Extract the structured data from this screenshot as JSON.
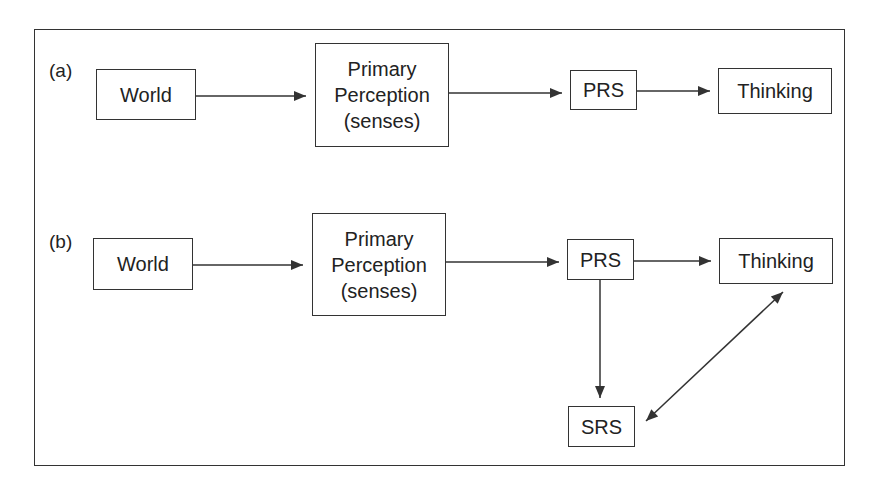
{
  "diagram": {
    "panels": [
      {
        "label": "(a)",
        "nodes": {
          "world": "World",
          "primary_perception": "Primary\nPerception\n(senses)",
          "prs": "PRS",
          "thinking": "Thinking"
        },
        "edges": [
          {
            "from": "World",
            "to": "Primary Perception (senses)",
            "type": "directed"
          },
          {
            "from": "Primary Perception (senses)",
            "to": "PRS",
            "type": "directed"
          },
          {
            "from": "PRS",
            "to": "Thinking",
            "type": "directed"
          }
        ]
      },
      {
        "label": "(b)",
        "nodes": {
          "world": "World",
          "primary_perception": "Primary\nPerception\n(senses)",
          "prs": "PRS",
          "thinking": "Thinking",
          "srs": "SRS"
        },
        "edges": [
          {
            "from": "World",
            "to": "Primary Perception (senses)",
            "type": "directed"
          },
          {
            "from": "Primary Perception (senses)",
            "to": "PRS",
            "type": "directed"
          },
          {
            "from": "PRS",
            "to": "Thinking",
            "type": "directed"
          },
          {
            "from": "PRS",
            "to": "SRS",
            "type": "directed"
          },
          {
            "from": "SRS",
            "to": "Thinking",
            "type": "bidirectional"
          }
        ]
      }
    ],
    "colors": {
      "stroke": "#333333",
      "text": "#222222",
      "background": "#ffffff"
    }
  }
}
